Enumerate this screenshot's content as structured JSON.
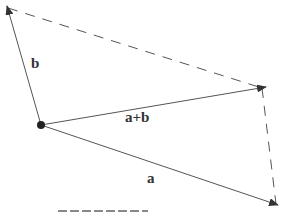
{
  "diagram": {
    "labels": {
      "a": "a",
      "b": "b",
      "sum": "a+b"
    },
    "caption": "",
    "colors": {
      "line": "#555555",
      "arrowhead": "#333333",
      "dashed": "#555555",
      "origin": "#222222"
    }
  }
}
